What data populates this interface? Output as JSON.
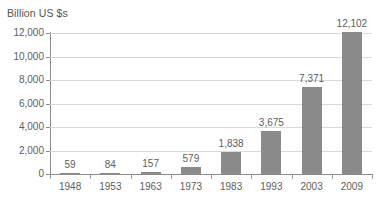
{
  "chart_data": {
    "type": "bar",
    "title": "",
    "ylabel": "Billion US $s",
    "xlabel": "",
    "categories": [
      "1948",
      "1953",
      "1963",
      "1973",
      "1983",
      "1993",
      "2003",
      "2009"
    ],
    "values": [
      59,
      84,
      157,
      579,
      1838,
      3675,
      7371,
      12102
    ],
    "value_labels": [
      "59",
      "84",
      "157",
      "579",
      "1,838",
      "3,675",
      "7,371",
      "12,102"
    ],
    "ylim": [
      0,
      12000
    ],
    "yticks": [
      0,
      2000,
      4000,
      6000,
      8000,
      10000,
      12000
    ],
    "ytick_labels": [
      "0",
      "2,000",
      "4,000",
      "6,000",
      "8,000",
      "10,000",
      "12,000"
    ],
    "grid": true,
    "legend": false,
    "bar_color": "#8a8a8a",
    "gridline_color": "#d9d9d9",
    "axis_color": "#8c8c8c",
    "text_color": "#5d5d5d",
    "background_color": "#ffffff"
  }
}
